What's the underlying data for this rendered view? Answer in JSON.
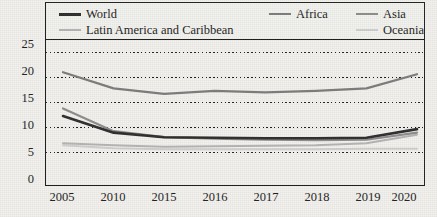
{
  "chart_data": {
    "type": "line",
    "title": "",
    "subtitle": "",
    "xlabel": "",
    "ylabel": "Percentage",
    "categories": [
      "2005",
      "2010",
      "2015",
      "2016",
      "2017",
      "2018",
      "2019",
      "2020"
    ],
    "x_tick_labels": [
      "2005",
      "2010",
      "2015",
      "2016",
      "2017",
      "2018",
      "2019",
      "2020"
    ],
    "y_tick_labels": [
      "0",
      "5",
      "10",
      "15",
      "20",
      "25"
    ],
    "y_ticks": [
      0,
      5,
      10,
      15,
      20,
      25
    ],
    "ylim": [
      0,
      27
    ],
    "grid": "horizontal-dotted",
    "legend_position": "top-inside-box",
    "series": [
      {
        "name": "World",
        "color": "#2c2c2c",
        "width": 2.6,
        "values": [
          12.3,
          9.0,
          8.1,
          8.0,
          7.9,
          7.9,
          8.0,
          9.7
        ]
      },
      {
        "name": "Africa",
        "color": "#7b7b7b",
        "width": 2.2,
        "values": [
          21.0,
          17.8,
          16.7,
          17.3,
          17.0,
          17.3,
          17.8,
          20.6
        ]
      },
      {
        "name": "Asia",
        "color": "#8c8c8c",
        "width": 2.2,
        "values": [
          13.8,
          9.3,
          8.1,
          7.8,
          7.6,
          7.5,
          7.6,
          9.0
        ]
      },
      {
        "name": "Latin America and Caribbean",
        "color": "#b4b4b4",
        "width": 2.0,
        "values": [
          6.9,
          6.5,
          6.2,
          6.3,
          6.4,
          6.5,
          6.9,
          8.6
        ]
      },
      {
        "name": "Oceania",
        "color": "#cfcfcf",
        "width": 2.0,
        "values": [
          6.5,
          5.9,
          5.7,
          5.7,
          5.7,
          5.7,
          5.8,
          5.8
        ]
      }
    ]
  },
  "legend": {
    "items": [
      {
        "label": "World"
      },
      {
        "label": "Africa"
      },
      {
        "label": "Asia"
      },
      {
        "label": "Latin America and Caribbean"
      },
      {
        "label": "Oceania"
      }
    ]
  },
  "axes": {
    "y_title": "Percentage"
  },
  "colors": {
    "background": "#f2f1ee",
    "frame": "#1d1d1d",
    "gridline": "#1d1d1d",
    "text": "#1b1b1b"
  }
}
